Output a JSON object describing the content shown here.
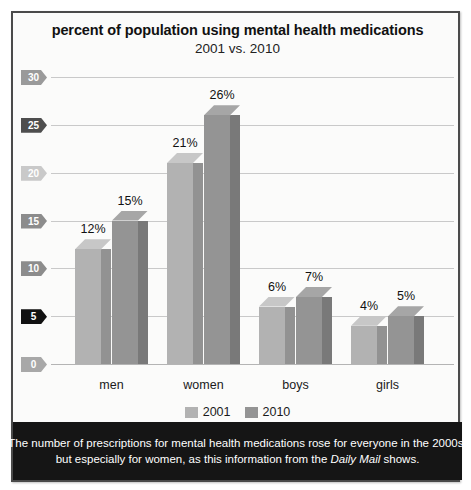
{
  "chart_data": {
    "type": "bar",
    "title": "percent of population using mental health medications",
    "subtitle": "2001 vs. 2010",
    "xlabel": "",
    "ylabel": "",
    "ylim": [
      0,
      30
    ],
    "yticks": [
      0,
      5,
      10,
      15,
      20,
      25,
      30
    ],
    "ytick_labels": [
      "0",
      "5",
      "10",
      "15",
      "20",
      "25",
      "30"
    ],
    "grid": true,
    "legend_position": "bottom",
    "categories": [
      "men",
      "women",
      "boys",
      "girls"
    ],
    "series": [
      {
        "name": "2001",
        "color": "#b2b2b2",
        "values": [
          12,
          21,
          6,
          4
        ],
        "labels": [
          "12%",
          "21%",
          "6%",
          "4%"
        ]
      },
      {
        "name": "2010",
        "color": "#949494",
        "values": [
          15,
          26,
          7,
          5
        ],
        "labels": [
          "15%",
          "26%",
          "7%",
          "5%"
        ]
      }
    ]
  },
  "ytick_styles": [
    {
      "value": "30",
      "bg": "#9a9a9a"
    },
    {
      "value": "25",
      "bg": "#4e4e4e"
    },
    {
      "value": "20",
      "bg": "#c9c9c9"
    },
    {
      "value": "15",
      "bg": "#8c8c8c"
    },
    {
      "value": "10",
      "bg": "#8c8c8c"
    },
    {
      "value": "5",
      "bg": "#111111"
    },
    {
      "value": "0",
      "bg": "#a8a8a8"
    }
  ],
  "legend": {
    "items": [
      {
        "label": "2001",
        "color": "#b2b2b2"
      },
      {
        "label": "2010",
        "color": "#949494"
      }
    ]
  },
  "caption": {
    "line1": "The number of prescriptions for mental health medications rose for everyone in the 2000s,",
    "line2_before": "but especially for women, as this information from the ",
    "line2_italic": "Daily Mail",
    "line2_after": " shows."
  },
  "colors": {
    "panel_background": "#fbfbfa",
    "panel_border": "#4a4a4a",
    "gridline": "#c9c9c9",
    "caption_background": "#151515",
    "caption_text": "#ffffff"
  }
}
